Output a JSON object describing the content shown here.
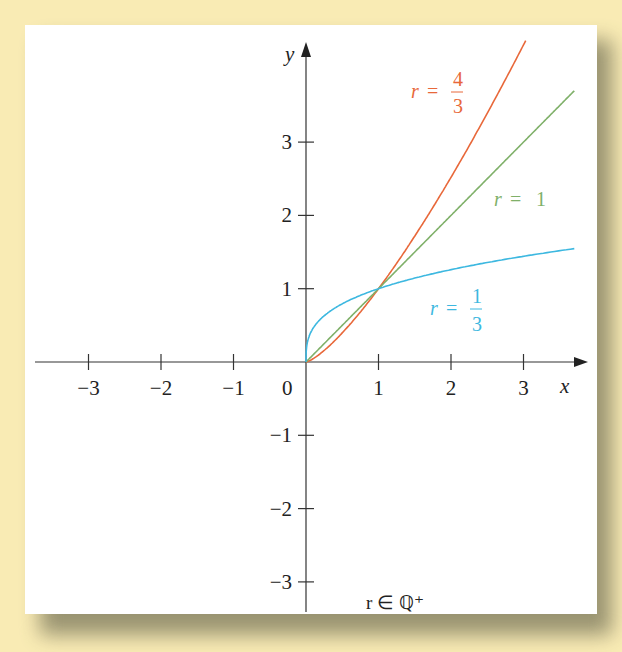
{
  "figure": {
    "background_color": "#f9ebb4",
    "panel_color": "#ffffff",
    "note": "r ∈ ℚ⁺"
  },
  "axes": {
    "x_label": "x",
    "y_label": "y",
    "origin_label": "0",
    "x_ticks": [
      "−3",
      "−2",
      "−1",
      "1",
      "2",
      "3"
    ],
    "y_ticks": [
      "3",
      "2",
      "1",
      "−1",
      "−2",
      "−3"
    ]
  },
  "labels": {
    "r_four_thirds": {
      "lhs": "r",
      "eq": "=",
      "num": "4",
      "den": "3",
      "color": "#e8683a"
    },
    "r_one": {
      "lhs": "r",
      "eq": "=",
      "val": "1",
      "color": "#7fb069"
    },
    "r_one_third": {
      "lhs": "r",
      "eq": "=",
      "num": "1",
      "den": "3",
      "color": "#3db8e0"
    }
  },
  "chart_data": {
    "type": "line",
    "title": "",
    "xlabel": "x",
    "ylabel": "y",
    "xlim": [
      -3.5,
      3.8
    ],
    "ylim": [
      -3.3,
      4.4
    ],
    "x_ticks": [
      -3,
      -2,
      -1,
      1,
      2,
      3
    ],
    "y_ticks": [
      -3,
      -2,
      -1,
      1,
      2,
      3
    ],
    "grid": false,
    "annotation": "r ∈ ℚ⁺",
    "series": [
      {
        "name": "r = 4/3",
        "function": "y = x^(4/3)",
        "color": "#e8683a",
        "x": [
          0,
          0.5,
          1,
          1.5,
          2,
          2.5,
          3.0
        ],
        "values": [
          0,
          0.4,
          1,
          1.72,
          2.52,
          3.39,
          4.33
        ]
      },
      {
        "name": "r = 1",
        "function": "y = x",
        "color": "#7fb069",
        "x": [
          0,
          1,
          2,
          3,
          3.8
        ],
        "values": [
          0,
          1,
          2,
          3,
          3.8
        ]
      },
      {
        "name": "r = 1/3",
        "function": "y = x^(1/3)",
        "color": "#3db8e0",
        "x": [
          0,
          0.125,
          0.5,
          1,
          2,
          3,
          3.8
        ],
        "values": [
          0,
          0.5,
          0.79,
          1,
          1.26,
          1.44,
          1.56
        ]
      }
    ]
  }
}
